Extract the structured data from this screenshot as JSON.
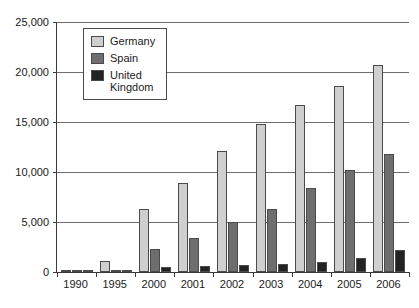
{
  "chart_data": {
    "type": "bar",
    "title": "",
    "subtitle": "",
    "xlabel": "",
    "ylabel": "",
    "grid": true,
    "legend_position": "top-left-inside",
    "categories": [
      "1990",
      "1995",
      "2000",
      "2001",
      "2002",
      "2003",
      "2004",
      "2005",
      "2006"
    ],
    "ylim": [
      0,
      25000
    ],
    "yticks": [
      0,
      5000,
      10000,
      15000,
      20000,
      25000
    ],
    "ytick_labels": [
      "0",
      "5,000",
      "10,000",
      "15,000",
      "20,000",
      "25,000"
    ],
    "series": [
      {
        "name": "Germany",
        "color": "#cfcfcf",
        "values": [
          60,
          1100,
          6300,
          8900,
          12100,
          14800,
          16700,
          18600,
          20700
        ]
      },
      {
        "name": "Spain",
        "color": "#6e6e6e",
        "values": [
          30,
          250,
          2350,
          3400,
          5000,
          6300,
          8400,
          10200,
          11800
        ]
      },
      {
        "name": "United Kingdom",
        "color": "#232323",
        "values": [
          20,
          220,
          500,
          600,
          700,
          800,
          1000,
          1400,
          2200
        ]
      }
    ]
  },
  "legend": {
    "items": [
      {
        "label": "Germany"
      },
      {
        "label": "Spain"
      },
      {
        "label": "United\nKingdom"
      }
    ]
  }
}
